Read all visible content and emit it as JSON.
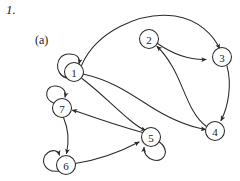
{
  "figure": {
    "problem_number": "1.",
    "part_label": "(a)",
    "type": "directed-graph",
    "background_color": "#ffffff",
    "stroke_color": "#2b2b2b",
    "text_color": "#1a1a1a"
  },
  "graph": {
    "node_radius": 9.5,
    "nodes": [
      {
        "id": "1",
        "label": "1",
        "cx": 74,
        "cy": 72
      },
      {
        "id": "2",
        "label": "2",
        "cx": 149,
        "cy": 39
      },
      {
        "id": "3",
        "label": "3",
        "cx": 222,
        "cy": 57
      },
      {
        "id": "4",
        "label": "4",
        "cx": 215,
        "cy": 131
      },
      {
        "id": "5",
        "label": "5",
        "cx": 151,
        "cy": 137
      },
      {
        "id": "6",
        "label": "6",
        "cx": 66,
        "cy": 165
      },
      {
        "id": "7",
        "label": "7",
        "cx": 62,
        "cy": 108
      }
    ],
    "edges": [
      {
        "from": "1",
        "to": "1",
        "kind": "self-loop"
      },
      {
        "from": "1",
        "to": "3",
        "kind": "arc"
      },
      {
        "from": "1",
        "to": "4",
        "kind": "arc"
      },
      {
        "from": "1",
        "to": "5",
        "kind": "arc"
      },
      {
        "from": "2",
        "to": "3",
        "kind": "arc"
      },
      {
        "from": "3",
        "to": "4",
        "kind": "arc"
      },
      {
        "from": "4",
        "to": "2",
        "kind": "arc"
      },
      {
        "from": "5",
        "to": "5",
        "kind": "self-loop"
      },
      {
        "from": "5",
        "to": "7",
        "kind": "arc"
      },
      {
        "from": "6",
        "to": "6",
        "kind": "self-loop"
      },
      {
        "from": "6",
        "to": "5",
        "kind": "arc"
      },
      {
        "from": "7",
        "to": "7",
        "kind": "self-loop"
      },
      {
        "from": "7",
        "to": "6",
        "kind": "arc"
      }
    ]
  }
}
